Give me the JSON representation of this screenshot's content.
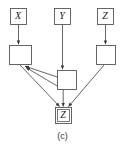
{
  "figure": {
    "caption": "(c)",
    "stroke_color": "#555555",
    "text_color": "#1a1a1a",
    "background": "#ffffff"
  },
  "nodes": {
    "top_labels": [
      {
        "id": "x-label-node",
        "text": "X",
        "x": 10,
        "y": 8,
        "w": 17,
        "h": 17
      },
      {
        "id": "y-label-node",
        "text": "Y",
        "x": 54,
        "y": 8,
        "w": 17,
        "h": 17
      },
      {
        "id": "z-label-node",
        "text": "Z",
        "x": 97,
        "y": 8,
        "w": 17,
        "h": 17
      }
    ],
    "plates": [
      {
        "id": "left-plate",
        "x": 9,
        "y": 45,
        "w": 22,
        "h": 20
      },
      {
        "id": "middle-plate",
        "x": 57,
        "y": 70,
        "w": 20,
        "h": 20
      },
      {
        "id": "right-plate",
        "x": 96,
        "y": 45,
        "w": 20,
        "h": 20
      }
    ],
    "observed": {
      "id": "z-observed-node",
      "text": "Z",
      "x": 55,
      "y": 107,
      "w": 16,
      "h": 16
    }
  },
  "edges": [
    {
      "id": "edge-x-to-left-plate",
      "from": "x-label-node",
      "to": "left-plate"
    },
    {
      "id": "edge-y-to-middle-plate",
      "from": "y-label-node",
      "to": "middle-plate"
    },
    {
      "id": "edge-z-to-right-plate",
      "from": "z-label-node",
      "to": "right-plate"
    },
    {
      "id": "edge-middle-plate-to-left-plate-upper",
      "from": "middle-plate",
      "to": "left-plate"
    },
    {
      "id": "edge-middle-plate-to-left-plate-lower",
      "from": "middle-plate",
      "to": "left-plate"
    },
    {
      "id": "edge-left-plate-to-z-observed",
      "from": "left-plate",
      "to": "z-observed-node"
    },
    {
      "id": "edge-middle-plate-to-z-observed",
      "from": "middle-plate",
      "to": "z-observed-node"
    },
    {
      "id": "edge-right-plate-to-z-observed",
      "from": "right-plate",
      "to": "z-observed-node"
    }
  ]
}
